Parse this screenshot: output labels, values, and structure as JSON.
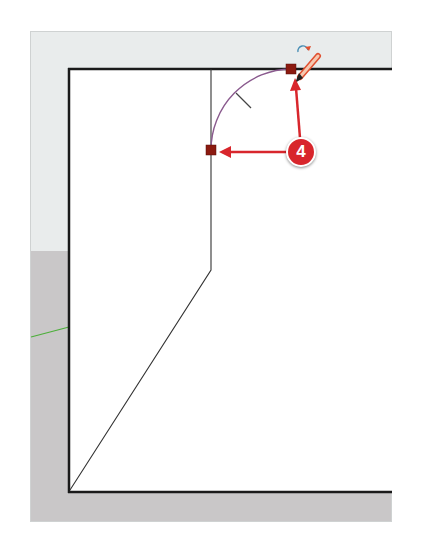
{
  "callout": {
    "label": "4",
    "color": "#d8262c"
  },
  "drawing": {
    "line_color": "#1a1a1a",
    "arc_color": "#8a5a8e",
    "marker_color": "#8b1a10",
    "inference_line_color": "#4caf3a"
  },
  "icons": [
    "pencil-cursor-icon",
    "rotate-arrow-icon",
    "endpoint-marker-icon"
  ]
}
